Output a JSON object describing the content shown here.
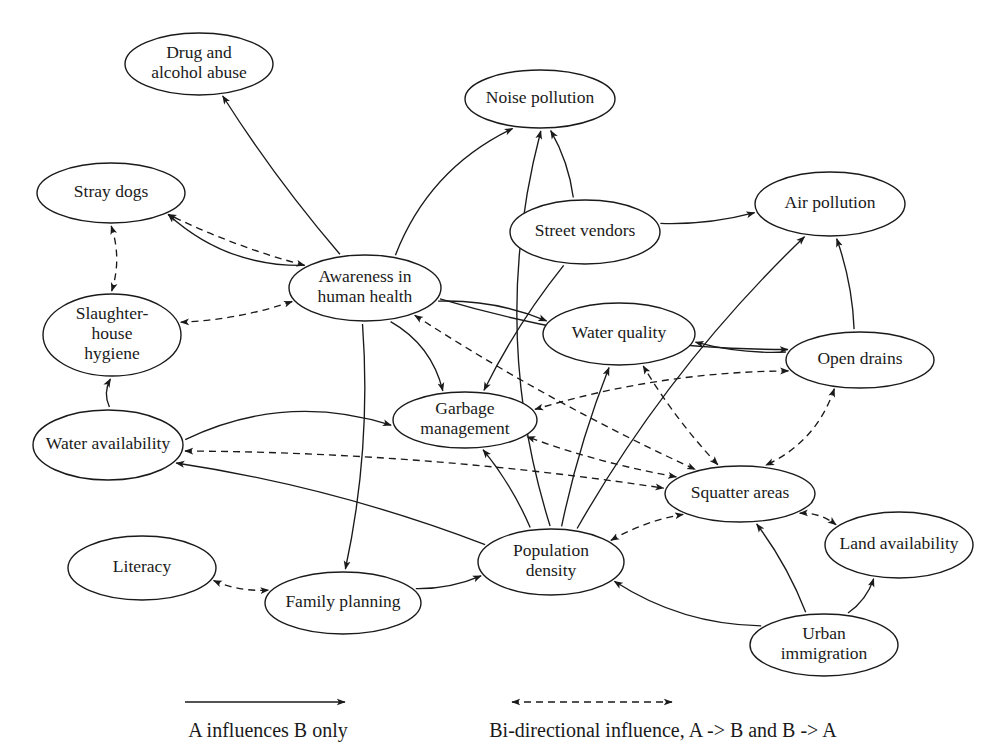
{
  "diagram": {
    "background_color": "#ffffff",
    "line_color": "#1a1a1a",
    "nodes": [
      {
        "id": "drug",
        "label": "Drug and\nalcohol abuse",
        "lines": [
          "Drug and",
          "alcohol abuse"
        ],
        "cx": 199,
        "cy": 64,
        "rx": 74,
        "ry": 31
      },
      {
        "id": "noise",
        "label": "Noise pollution",
        "lines": [
          "Noise pollution"
        ],
        "cx": 540,
        "cy": 99,
        "rx": 75,
        "ry": 29
      },
      {
        "id": "stray",
        "label": "Stray dogs",
        "lines": [
          "Stray dogs"
        ],
        "cx": 111,
        "cy": 193,
        "rx": 74,
        "ry": 30
      },
      {
        "id": "air",
        "label": "Air pollution",
        "lines": [
          "Air pollution"
        ],
        "cx": 830,
        "cy": 204,
        "rx": 75,
        "ry": 32
      },
      {
        "id": "vendors",
        "label": "Street vendors",
        "lines": [
          "Street vendors"
        ],
        "cx": 585,
        "cy": 232,
        "rx": 75,
        "ry": 32
      },
      {
        "id": "awareness",
        "label": "Awareness in\nhuman health",
        "lines": [
          "Awareness in",
          "human health"
        ],
        "cx": 365,
        "cy": 288,
        "rx": 76,
        "ry": 33
      },
      {
        "id": "slaughter",
        "label": "Slaughter-\nhouse\nhygiene",
        "lines": [
          "Slaughter-",
          "house",
          "hygiene"
        ],
        "cx": 112,
        "cy": 335,
        "rx": 69,
        "ry": 41
      },
      {
        "id": "water_q",
        "label": "Water quality",
        "lines": [
          "Water quality"
        ],
        "cx": 619,
        "cy": 334,
        "rx": 76,
        "ry": 31
      },
      {
        "id": "drains",
        "label": "Open drains",
        "lines": [
          "Open drains"
        ],
        "cx": 860,
        "cy": 360,
        "rx": 74,
        "ry": 28
      },
      {
        "id": "garbage",
        "label": "Garbage\nmanagement",
        "lines": [
          "Garbage",
          "management"
        ],
        "cx": 465,
        "cy": 420,
        "rx": 72,
        "ry": 28
      },
      {
        "id": "water_a",
        "label": "Water availability",
        "lines": [
          "Water availability"
        ],
        "cx": 108,
        "cy": 445,
        "rx": 75,
        "ry": 35
      },
      {
        "id": "squatter",
        "label": "Squatter areas",
        "lines": [
          "Squatter areas"
        ],
        "cx": 740,
        "cy": 494,
        "rx": 75,
        "ry": 28
      },
      {
        "id": "land",
        "label": "Land availability",
        "lines": [
          "Land availability"
        ],
        "cx": 899,
        "cy": 545,
        "rx": 74,
        "ry": 33
      },
      {
        "id": "popdens",
        "label": "Population\ndensity",
        "lines": [
          "Population",
          "density"
        ],
        "cx": 551,
        "cy": 562,
        "rx": 73,
        "ry": 33
      },
      {
        "id": "literacy",
        "label": "Literacy",
        "lines": [
          "Literacy"
        ],
        "cx": 142,
        "cy": 568,
        "rx": 74,
        "ry": 32
      },
      {
        "id": "family",
        "label": "Family planning",
        "lines": [
          "Family planning"
        ],
        "cx": 343,
        "cy": 603,
        "rx": 78,
        "ry": 31
      },
      {
        "id": "urban",
        "label": "Urban\nimmigration",
        "lines": [
          "Urban",
          "immigration"
        ],
        "cx": 824,
        "cy": 645,
        "rx": 74,
        "ry": 31
      }
    ],
    "edges": [
      {
        "from": "awareness",
        "to": "drug",
        "type": "uni"
      },
      {
        "from": "awareness",
        "to": "noise",
        "type": "uni"
      },
      {
        "from": "awareness",
        "to": "stray",
        "type": "uni"
      },
      {
        "from": "awareness",
        "to": "stray",
        "type": "bi"
      },
      {
        "from": "awareness",
        "to": "slaughter",
        "type": "bi"
      },
      {
        "from": "awareness",
        "to": "water_q",
        "type": "uni"
      },
      {
        "from": "awareness",
        "to": "garbage",
        "type": "uni"
      },
      {
        "from": "awareness",
        "to": "drains",
        "type": "uni"
      },
      {
        "from": "awareness",
        "to": "family",
        "type": "uni"
      },
      {
        "from": "awareness",
        "to": "squatter",
        "type": "bi"
      },
      {
        "from": "vendors",
        "to": "noise",
        "type": "uni"
      },
      {
        "from": "vendors",
        "to": "garbage",
        "type": "uni"
      },
      {
        "from": "vendors",
        "to": "air",
        "type": "uni"
      },
      {
        "from": "popdens",
        "to": "noise",
        "type": "uni"
      },
      {
        "from": "popdens",
        "to": "water_q",
        "type": "uni"
      },
      {
        "from": "popdens",
        "to": "garbage",
        "type": "uni"
      },
      {
        "from": "popdens",
        "to": "air",
        "type": "uni"
      },
      {
        "from": "popdens",
        "to": "squatter",
        "type": "bi"
      },
      {
        "from": "popdens",
        "to": "water_a",
        "type": "uni"
      },
      {
        "from": "drains",
        "to": "air",
        "type": "uni"
      },
      {
        "from": "drains",
        "to": "water_q",
        "type": "uni"
      },
      {
        "from": "drains",
        "to": "squatter",
        "type": "bi"
      },
      {
        "from": "drains",
        "to": "garbage",
        "type": "bi"
      },
      {
        "from": "squatter",
        "to": "water_q",
        "type": "bi"
      },
      {
        "from": "squatter",
        "to": "garbage",
        "type": "bi"
      },
      {
        "from": "squatter",
        "to": "land",
        "type": "bi"
      },
      {
        "from": "water_a",
        "to": "slaughter",
        "type": "uni"
      },
      {
        "from": "water_a",
        "to": "garbage",
        "type": "uni"
      },
      {
        "from": "water_a",
        "to": "squatter",
        "type": "bi"
      },
      {
        "from": "stray",
        "to": "slaughter",
        "type": "bi"
      },
      {
        "from": "literacy",
        "to": "family",
        "type": "bi"
      },
      {
        "from": "family",
        "to": "popdens",
        "type": "uni"
      },
      {
        "from": "urban",
        "to": "popdens",
        "type": "uni"
      },
      {
        "from": "urban",
        "to": "squatter",
        "type": "uni"
      },
      {
        "from": "urban",
        "to": "land",
        "type": "uni"
      }
    ]
  },
  "legend": {
    "uni_label": "A influences B only",
    "bi_label": "Bi-directional influence, A -> B and B -> A"
  }
}
